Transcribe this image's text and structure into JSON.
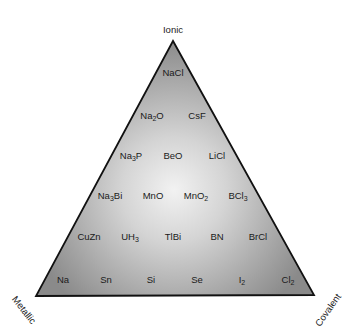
{
  "diagram": {
    "vertices": {
      "top": "Ionic",
      "bottom_left": "Metallic",
      "bottom_right": "Covalent"
    },
    "colors": {
      "center_fill": "#eeeeee",
      "edge_fill": "#8a8a8a",
      "outline": "#111111",
      "text": "#1a1a1a"
    },
    "rows": [
      {
        "items": [
          {
            "base": "NaCl",
            "sub": "",
            "rest": "",
            "x": 173,
            "y": 73
          }
        ]
      },
      {
        "items": [
          {
            "base": "Na",
            "sub": "2",
            "rest": "O",
            "x": 152,
            "y": 116
          },
          {
            "base": "CsF",
            "sub": "",
            "rest": "",
            "x": 197,
            "y": 116
          }
        ]
      },
      {
        "items": [
          {
            "base": "Na",
            "sub": "3",
            "rest": "P",
            "x": 131,
            "y": 156
          },
          {
            "base": "BeO",
            "sub": "",
            "rest": "",
            "x": 173,
            "y": 156
          },
          {
            "base": "LiCl",
            "sub": "",
            "rest": "",
            "x": 217,
            "y": 156
          }
        ]
      },
      {
        "items": [
          {
            "base": "Na",
            "sub": "3",
            "rest": "Bi",
            "x": 110,
            "y": 196
          },
          {
            "base": "MnO",
            "sub": "",
            "rest": "",
            "x": 153,
            "y": 196
          },
          {
            "base": "MnO",
            "sub": "2",
            "rest": "",
            "x": 196,
            "y": 196
          },
          {
            "base": "BCl",
            "sub": "3",
            "rest": "",
            "x": 238,
            "y": 196
          }
        ]
      },
      {
        "items": [
          {
            "base": "CuZn",
            "sub": "",
            "rest": "",
            "x": 89,
            "y": 237
          },
          {
            "base": "UH",
            "sub": "3",
            "rest": "",
            "x": 130,
            "y": 237
          },
          {
            "base": "TlBi",
            "sub": "",
            "rest": "",
            "x": 173,
            "y": 237
          },
          {
            "base": "BN",
            "sub": "",
            "rest": "",
            "x": 217,
            "y": 237
          },
          {
            "base": "BrCl",
            "sub": "",
            "rest": "",
            "x": 258,
            "y": 237
          }
        ]
      },
      {
        "items": [
          {
            "base": "Na",
            "sub": "",
            "rest": "",
            "x": 63,
            "y": 280
          },
          {
            "base": "Sn",
            "sub": "",
            "rest": "",
            "x": 106,
            "y": 280
          },
          {
            "base": "Si",
            "sub": "",
            "rest": "",
            "x": 151,
            "y": 280
          },
          {
            "base": "Se",
            "sub": "",
            "rest": "",
            "x": 197,
            "y": 280
          },
          {
            "base": "I",
            "sub": "2",
            "rest": "",
            "x": 242,
            "y": 280
          },
          {
            "base": "Cl",
            "sub": "2",
            "rest": "",
            "x": 288,
            "y": 280
          }
        ]
      }
    ]
  }
}
